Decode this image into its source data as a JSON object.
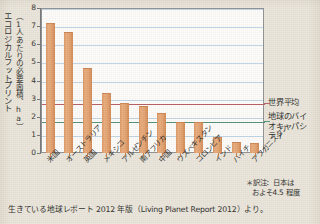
{
  "figure": {
    "background_color": "#E9E4D9",
    "plot_background_color": "#FDFCFA",
    "bar_color": "#E09A63",
    "gridline_color": "#BDD3E6",
    "world_average_line_color": "#B4585F",
    "biocapacity_line_color": "#4B8F72"
  },
  "y_axis": {
    "title_main": "エコロジカルフットプリント",
    "title_sub": "（1人あたりの必要面積、ha）",
    "ticks": [
      "0",
      "1",
      "2",
      "3",
      "4",
      "5",
      "6",
      "7",
      "8"
    ],
    "min": 0,
    "max": 8
  },
  "annotations": {
    "world_average_label": "世界平均",
    "biocapacity_label": "地球のバイオキャパシティ",
    "biocapacity_label_lines": [
      "地球のバイ",
      "オキャパシ",
      "ティ"
    ],
    "translator_note_line1": "＊訳注：日本は",
    "translator_note_line2": "およそ4.5 程度"
  },
  "source": {
    "text": "生きている地球レポート 2012 年版（Living Planet Report 2012）より。"
  },
  "chart_data": {
    "type": "bar",
    "title": "",
    "xlabel": "",
    "ylabel": "エコロジカルフットプリント（1人あたりの必要面積、ha）",
    "ylim": [
      0,
      8
    ],
    "grid": true,
    "legend_position": "right",
    "categories": [
      "米国",
      "オーストラリア",
      "英国",
      "メキシコ",
      "アルゼンチン",
      "南アフリカ",
      "中国",
      "ウズベキスタン",
      "コロンビア",
      "インド",
      "ハイチ",
      "アフガニスタン"
    ],
    "values": [
      7.2,
      6.65,
      4.7,
      3.3,
      2.75,
      2.6,
      2.2,
      1.7,
      1.7,
      0.9,
      0.6,
      0.55
    ],
    "reference_lines": [
      {
        "name": "世界平均",
        "value": 2.75,
        "color": "#B4585F"
      },
      {
        "name": "地球のバイオキャパシティ",
        "value": 1.75,
        "color": "#4B8F72"
      }
    ],
    "yticks": [
      0,
      1,
      2,
      3,
      4,
      5,
      6,
      7,
      8
    ]
  }
}
